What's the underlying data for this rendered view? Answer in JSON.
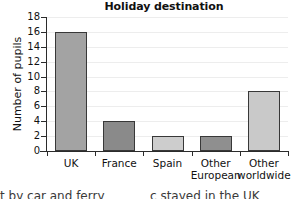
{
  "chart_data": {
    "type": "bar",
    "title": "Holiday destination",
    "xlabel": "",
    "ylabel": "Number of pupils",
    "categories": [
      "UK",
      "France",
      "Spain",
      "Other European",
      "Other worldwide"
    ],
    "category_lines": [
      [
        "UK",
        ""
      ],
      [
        "France",
        ""
      ],
      [
        "Spain",
        ""
      ],
      [
        "Other",
        "European"
      ],
      [
        "Other",
        "worldwide"
      ]
    ],
    "values": [
      16,
      4,
      2,
      2,
      8
    ],
    "ylim": [
      0,
      18
    ],
    "yticks": [
      0,
      2,
      4,
      6,
      8,
      10,
      12,
      14,
      16,
      18
    ],
    "ytick_labels": [
      "0",
      "2",
      "4",
      "6",
      "8",
      "10",
      "12",
      "14",
      "16",
      "18"
    ],
    "grid": true,
    "legend": false,
    "bar_colors": [
      "#a3a3a3",
      "#8a8a8a",
      "#cdcdcd",
      "#8f8f8f",
      "#c9c9c9"
    ],
    "bar_edge_color": "#383838",
    "axis_color": "#2b2b2b",
    "grid_color": "#ededed",
    "text_color": "#111111"
  },
  "footer": {
    "fragment_left": "t by car and ferry",
    "fragment_right": "c  stayed in the UK"
  }
}
